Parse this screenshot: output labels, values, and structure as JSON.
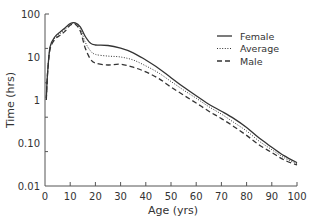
{
  "chart_data": {
    "type": "line",
    "title": "",
    "xlabel": "Age (yrs)",
    "ylabel": "Time (hrs)",
    "xscale": "linear",
    "yscale": "log",
    "xlim": [
      0,
      100
    ],
    "ylim": [
      0.01,
      100
    ],
    "grid": false,
    "legend_position": "upper right",
    "x_ticks": [
      0,
      10,
      20,
      30,
      40,
      50,
      60,
      70,
      80,
      90,
      100
    ],
    "y_tick_labels": [
      "100",
      "10",
      "1",
      "0.10",
      "0.01"
    ],
    "x": [
      0.5,
      1,
      2,
      4,
      6,
      8,
      10,
      12,
      14,
      16,
      18,
      20,
      25,
      30,
      35,
      40,
      45,
      50,
      55,
      60,
      65,
      70,
      75,
      80,
      85,
      90,
      95,
      100
    ],
    "series": [
      {
        "name": "Female",
        "style": "solid",
        "values": [
          1.1,
          4,
          17,
          30,
          38,
          48,
          60,
          62,
          50,
          30,
          21,
          19,
          18.5,
          16,
          12.5,
          8.5,
          5.5,
          3.3,
          2.0,
          1.25,
          0.8,
          0.55,
          0.37,
          0.23,
          0.13,
          0.08,
          0.05,
          0.035
        ]
      },
      {
        "name": "Average",
        "style": "dotted",
        "values": [
          1.0,
          4,
          16,
          28,
          35,
          44,
          58,
          60,
          45,
          22,
          14,
          11.5,
          10.5,
          10,
          8.5,
          6.2,
          4.3,
          2.7,
          1.7,
          1.1,
          0.7,
          0.47,
          0.3,
          0.19,
          0.11,
          0.07,
          0.045,
          0.033
        ]
      },
      {
        "name": "Male",
        "style": "dashed",
        "values": [
          1.0,
          4,
          15,
          26,
          32,
          40,
          55,
          58,
          40,
          16,
          9,
          7.2,
          6.5,
          6.8,
          5.8,
          4.5,
          3.2,
          2.0,
          1.3,
          0.85,
          0.55,
          0.37,
          0.24,
          0.15,
          0.09,
          0.06,
          0.04,
          0.031
        ]
      }
    ]
  },
  "legend": {
    "items": [
      {
        "label": "Female",
        "style": "solid"
      },
      {
        "label": "Average",
        "style": "dotted"
      },
      {
        "label": "Male",
        "style": "dashed"
      }
    ]
  },
  "colors": {
    "line": "#333333",
    "axis": "#555555"
  }
}
